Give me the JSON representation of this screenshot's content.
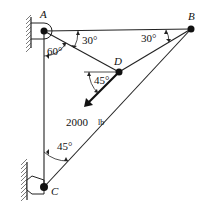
{
  "diagram": {
    "points": {
      "A": {
        "label": "A",
        "x": 44,
        "y": 31
      },
      "B": {
        "label": "B",
        "x": 191,
        "y": 29
      },
      "C": {
        "label": "C",
        "x": 44,
        "y": 187
      },
      "D": {
        "label": "D",
        "x": 119,
        "y": 72
      }
    },
    "angles": {
      "A_AD_from_AB": "30°",
      "A_AD_from_AC": "60°",
      "B_BD_from_BA": "30°",
      "D_force_from_horizontal": "45°",
      "C_CB_from_CA": "45°"
    },
    "load": {
      "value": "2000",
      "unit": "lb"
    }
  }
}
